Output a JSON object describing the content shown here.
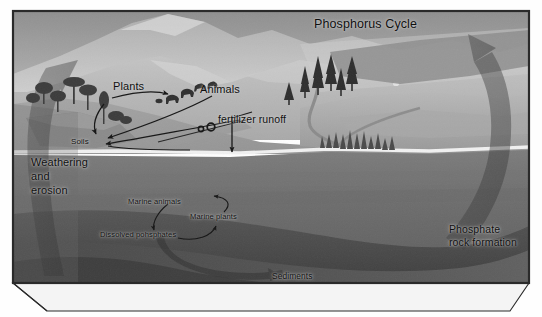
{
  "figure": {
    "title": "Phosphorus Cycle",
    "kind": "scientific-diagram",
    "style": "grayscale-textbook-illustration",
    "frame": "3d-block-diagram"
  },
  "labels": {
    "title": "Phosphorus Cycle",
    "plants": "Plants",
    "animals": "Animals",
    "fertilizer_runoff": "fertilizer runoff",
    "soils": "Soils",
    "weathering_and_erosion": "Weathering\nand\nerosion",
    "weathering_line1": "Weathering",
    "weathering_line2": "and",
    "weathering_line3": "erosion",
    "marine_animals": "Marine animals",
    "marine_plants": "Marine plants",
    "dissolved_phosphates": "Dissolved pohsphates",
    "sediments": "Sediments",
    "phosphate_rock_formation": "Phosphate\nrock formation",
    "phosrock_line1": "Phosphate",
    "phosrock_line2": "rock formation"
  },
  "scene": {
    "sky": "grey-overcast-sky",
    "mountains": "distant-mountain-range",
    "land": "sloping-terrain",
    "water_body": "ocean-cross-section",
    "seabed": "dark-sediment-layer",
    "deciduous_trees": "broadleaf-tree-cluster",
    "conifer_trees": "conifer-tree-cluster",
    "river": "river-flowing-to-delta",
    "delta_vegetation": "delta-marsh-vegetation",
    "farm_field": "sloped-farm-field",
    "farm_machine": "tractor-with-two-wheels"
  },
  "arrows": {
    "weathering_erosion": "large-curved-arrow-down-left",
    "phosphate_uplift": "large-curved-arrow-up-right",
    "plants_to_animals": "thin-arrow-plants-to-animals",
    "animals_to_soils": "thin-arrow-animals-to-soils",
    "plants_to_soils": "thin-arrow-plants-to-soils",
    "runoff_to_water": "vertical-arrow-into-water",
    "soils_to_water": "thin-arrow-soils-to-water",
    "marine_loop": "marine-nutrient-loop-arrows",
    "sediment_flow": "broad-arrow-to-sediments"
  },
  "colors": {
    "sky_top": "#9a9a9a",
    "sky_bottom": "#c9c9c9",
    "mountain_far": "#a8a8a8",
    "mountain_near": "#bdbdbd",
    "land_light": "#b4b4b4",
    "land_mid": "#9d9d9d",
    "water_surface": "#f2f2f2",
    "water_body": "#6e6e6e",
    "seabed": "#4e4e4e",
    "deep_rock": "#5a5a5a",
    "arrow_overlay": "#3f3f3f",
    "line": "#1a1a1a",
    "text": "#101010",
    "frame_border": "#2a2a2a",
    "block_face": "#e9e9e9"
  }
}
